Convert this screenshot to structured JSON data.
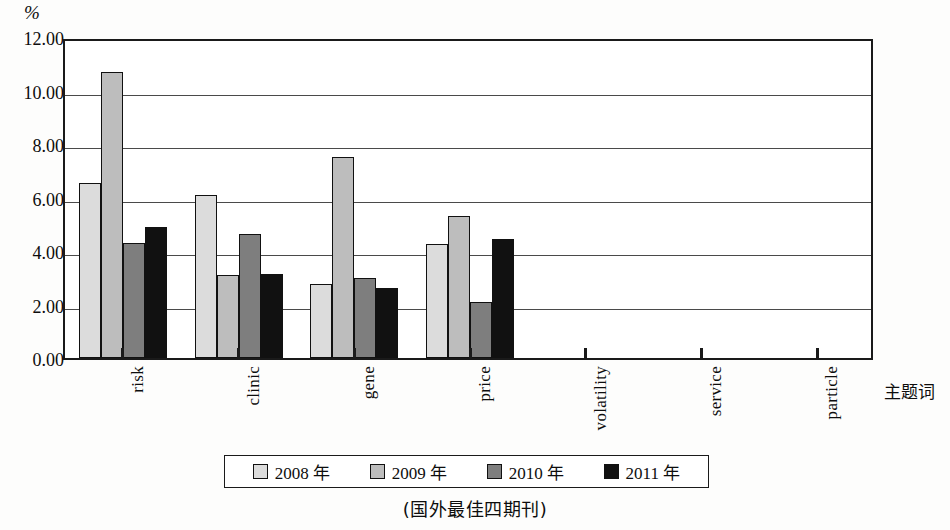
{
  "chart_data": {
    "type": "bar",
    "title": "",
    "subtitle": "",
    "xlabel": "主题词",
    "ylabel": "%",
    "ylim": [
      0,
      12
    ],
    "ytick_step": 2,
    "ytick_labels": [
      "0.00",
      "2.00",
      "4.00",
      "6.00",
      "8.00",
      "10.00",
      "12.00"
    ],
    "ytick_values": [
      0,
      2,
      4,
      6,
      8,
      10,
      12
    ],
    "grid": "horizontal",
    "legend_position": "bottom",
    "categories": [
      "risk",
      "clinic",
      "gene",
      "price",
      "volatility",
      "service",
      "particle"
    ],
    "series": [
      {
        "name": "2008 年",
        "color": "#dcdcdc",
        "values": [
          6.55,
          6.1,
          2.75,
          4.25,
          0,
          0,
          0
        ]
      },
      {
        "name": "2009 年",
        "color": "#bdbdbd",
        "values": [
          10.7,
          3.1,
          7.5,
          5.3,
          0,
          0,
          0
        ]
      },
      {
        "name": "2010 年",
        "color": "#7e7e7e",
        "values": [
          4.3,
          4.65,
          3.0,
          2.1,
          0,
          0,
          0
        ]
      },
      {
        "name": "2011 年",
        "color": "#111111",
        "values": [
          4.9,
          3.15,
          2.6,
          4.45,
          0,
          0,
          0
        ]
      }
    ]
  },
  "legend": {
    "items": [
      {
        "label": "2008 年"
      },
      {
        "label": "2009 年"
      },
      {
        "label": "2010 年"
      },
      {
        "label": "2011 年"
      }
    ]
  },
  "caption": "(国外最佳四期刊)"
}
